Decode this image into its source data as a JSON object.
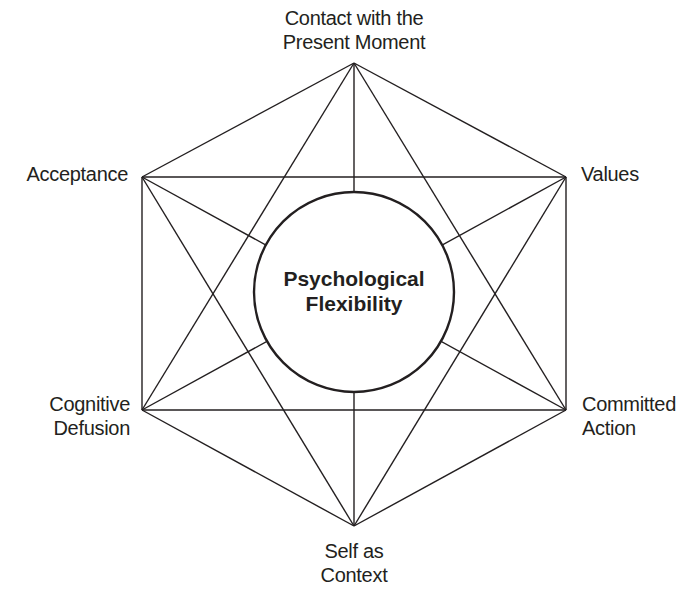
{
  "diagram": {
    "title": "Psychological Flexibility",
    "center": {
      "line1": "Psychological",
      "line2": "Flexibility"
    },
    "nodes": [
      {
        "id": "present_moment",
        "line1": "Contact with the",
        "line2": "Present Moment"
      },
      {
        "id": "values",
        "line1": "Values",
        "line2": ""
      },
      {
        "id": "committed_action",
        "line1": "Committed",
        "line2": "Action"
      },
      {
        "id": "self_as_context",
        "line1": "Self as",
        "line2": "Context"
      },
      {
        "id": "cognitive_defusion",
        "line1": "Cognitive",
        "line2": "Defusion"
      },
      {
        "id": "acceptance",
        "line1": "Acceptance",
        "line2": ""
      }
    ],
    "colors": {
      "line": "#231f20",
      "background": "#ffffff",
      "text": "#231f20"
    }
  }
}
